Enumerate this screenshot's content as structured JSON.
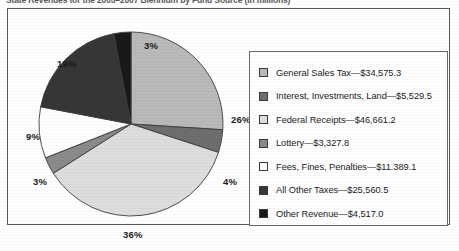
{
  "title": "State Revenues for the 2005–2007 Biennium by Fund Source (in millions)",
  "chart_data": {
    "type": "pie",
    "title": "State Revenues for the 2005–2007 Biennium by Fund Source (in millions)",
    "xlabel": "",
    "ylabel": "",
    "units": "millions of dollars",
    "legend_position": "right",
    "grid": false,
    "categories": [
      "General Sales Tax",
      "Interest, Investments, Land",
      "Federal Receipts",
      "Lottery",
      "Fees, Fines, Penalties",
      "All Other Taxes",
      "Other Revenue"
    ],
    "values": [
      34575.3,
      5529.5,
      46661.2,
      3327.8,
      11389.1,
      25560.5,
      4517.0
    ],
    "value_labels": [
      "$34,575.3",
      "$5,529.5",
      "$46,661.2",
      "$3,327.8",
      "$11.389.1",
      "$25,560.5",
      "$4,517.0"
    ],
    "percent_labels": [
      "26%",
      "4%",
      "36%",
      "3%",
      "9%",
      "19%",
      "3%"
    ],
    "percents": [
      26,
      4,
      36,
      3,
      9,
      19,
      3
    ],
    "colors": [
      "#b9b9b9",
      "#6e6e6e",
      "#dddddd",
      "#8a8a8a",
      "#ffffff",
      "#363636",
      "#191919"
    ],
    "legend_entries": [
      "General Sales Tax—$34,575.3",
      "Interest, Investments, Land—$5,529.5",
      "Federal Receipts—$46,661.2",
      "Lottery—$3,327.8",
      "Fees, Fines, Penalties—$11.389.1",
      "All Other Taxes—$25,560.5",
      "Other Revenue—$4,517.0"
    ]
  }
}
